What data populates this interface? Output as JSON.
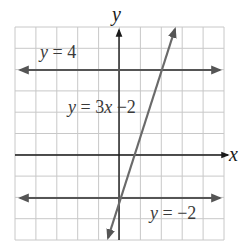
{
  "chart_data": {
    "type": "line",
    "title": "",
    "xlabel": "x",
    "ylabel": "y",
    "xlim": [
      -5,
      5
    ],
    "ylim": [
      -4,
      6
    ],
    "grid": true,
    "grid_step": 1,
    "legend": "inline labels",
    "series": [
      {
        "name": "y = 4",
        "equation": "y=4",
        "slope": 0,
        "intercept": 4,
        "x": [
          -5,
          5
        ],
        "y": [
          4,
          4
        ],
        "arrows": "both"
      },
      {
        "name": "y = 3x − 2",
        "equation": "y=3x-2",
        "slope": 3,
        "intercept": -2,
        "x": [
          -0.53,
          2.63
        ],
        "y": [
          -3.6,
          5.9
        ],
        "arrows": "both"
      },
      {
        "name": "y = −2",
        "equation": "y=-2",
        "slope": 0,
        "intercept": -2,
        "x": [
          -5,
          5
        ],
        "y": [
          -2,
          -2
        ],
        "arrows": "both"
      }
    ],
    "annotations": [
      {
        "text": "y = 4",
        "x": -4.3,
        "y": 4.5
      },
      {
        "text": "y = 3x −2",
        "x": -2.2,
        "y": 2.5
      },
      {
        "text": "y = −2",
        "x": 1.5,
        "y": -2.9
      }
    ]
  },
  "labels": {
    "x_axis": "x",
    "y_axis": "y",
    "line1": {
      "var": "y",
      "rest": " = 4"
    },
    "line2": {
      "var": "y",
      "mid": " = 3",
      "var2": "x",
      "rest": " −2"
    },
    "line3": {
      "var": "y",
      "rest": " = −2"
    }
  },
  "colors": {
    "grid": "#c8c8c8",
    "axes": "#1a1a1a",
    "lines": "#5a5a5a",
    "text": "#3a3a3a"
  }
}
